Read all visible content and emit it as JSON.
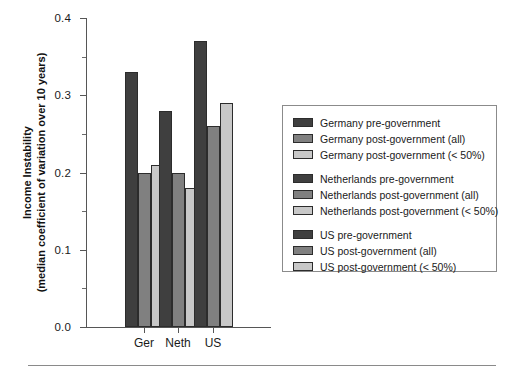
{
  "chart_data": {
    "type": "bar",
    "title": "",
    "xlabel": "",
    "ylabel_line1": "Income Instability",
    "ylabel_line2": "(median coefficient of variation over 10 years)",
    "categories": [
      "Ger",
      "Neth",
      "US"
    ],
    "ylim": [
      0.0,
      0.4
    ],
    "ytick_labels": [
      "0.0",
      "0.1",
      "0.2",
      "0.3",
      "0.4"
    ],
    "ytick_values": [
      0.0,
      0.1,
      0.2,
      0.3,
      0.4
    ],
    "yminor_values": [
      0.05,
      0.15,
      0.25,
      0.35
    ],
    "grid": false,
    "legend_position": "right",
    "series": [
      {
        "name": "pre-government",
        "values": [
          0.33,
          0.28,
          0.37
        ],
        "color": "#3f3f3f"
      },
      {
        "name": "post-government (all)",
        "values": [
          0.2,
          0.2,
          0.26
        ],
        "color": "#808080"
      },
      {
        "name": "post-government (< 50%)",
        "values": [
          0.21,
          0.18,
          0.29
        ],
        "color": "#c8c8c8"
      }
    ],
    "bars": [
      {
        "group": "Ger",
        "series": "pre-government",
        "value": 0.33,
        "color": "#3f3f3f"
      },
      {
        "group": "Ger",
        "series": "post-government (all)",
        "value": 0.2,
        "color": "#808080"
      },
      {
        "group": "Ger",
        "series": "post-government (< 50%)",
        "value": 0.21,
        "color": "#c8c8c8"
      },
      {
        "group": "Neth",
        "series": "pre-government",
        "value": 0.28,
        "color": "#3f3f3f"
      },
      {
        "group": "Neth",
        "series": "post-government (all)",
        "value": 0.2,
        "color": "#808080"
      },
      {
        "group": "Neth",
        "series": "post-government (< 50%)",
        "value": 0.18,
        "color": "#c8c8c8"
      },
      {
        "group": "US",
        "series": "pre-government",
        "value": 0.37,
        "color": "#3f3f3f"
      },
      {
        "group": "US",
        "series": "post-government (all)",
        "value": 0.26,
        "color": "#808080"
      },
      {
        "group": "US",
        "series": "post-government (< 50%)",
        "value": 0.29,
        "color": "#c8c8c8"
      }
    ],
    "legend": {
      "groups": [
        {
          "items": [
            {
              "label": "Germany pre-government",
              "color": "#3f3f3f"
            },
            {
              "label": "Germany post-government (all)",
              "color": "#808080"
            },
            {
              "label": "Germany post-government (< 50%)",
              "color": "#c8c8c8"
            }
          ]
        },
        {
          "items": [
            {
              "label": "Netherlands pre-government",
              "color": "#3f3f3f"
            },
            {
              "label": "Netherlands post-government (all)",
              "color": "#808080"
            },
            {
              "label": "Netherlands post-government (< 50%)",
              "color": "#c8c8c8"
            }
          ]
        },
        {
          "items": [
            {
              "label": "US pre-government",
              "color": "#3f3f3f"
            },
            {
              "label": "US post-government (all)",
              "color": "#808080"
            },
            {
              "label": "US post-government (< 50%)",
              "color": "#c8c8c8"
            }
          ]
        }
      ]
    }
  }
}
